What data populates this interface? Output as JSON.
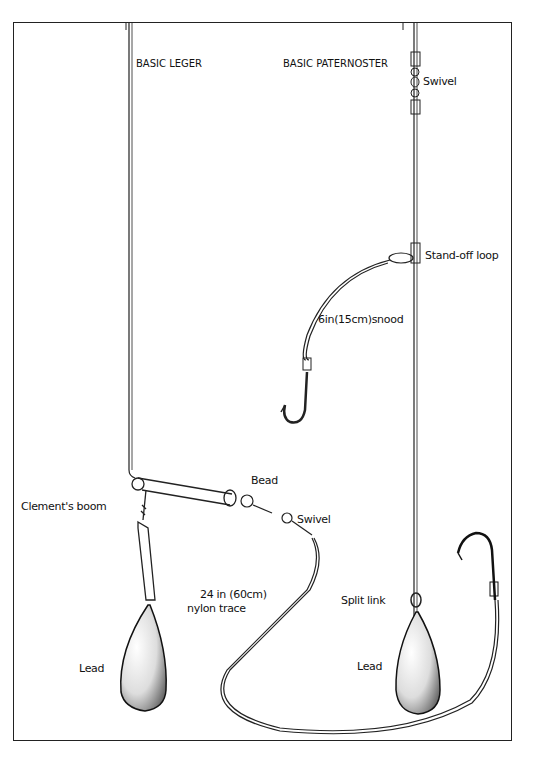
{
  "diagram": {
    "rigs": [
      {
        "title": "BASIC LEGER"
      },
      {
        "title": "BASIC PATERNOSTER"
      }
    ],
    "labels": {
      "swivel_top": "Swivel",
      "standoff_loop": "Stand-off loop",
      "snood": "6in(15cm)snood",
      "clements_boom": "Clement's boom",
      "bead": "Bead",
      "swivel_leger": "Swivel",
      "trace_line1": "24 in (60cm)",
      "trace_line2": "nylon trace",
      "split_link": "Split link",
      "lead_left": "Lead",
      "lead_right": "Lead"
    },
    "colors": {
      "ink": "#111111",
      "background": "#ffffff"
    }
  }
}
